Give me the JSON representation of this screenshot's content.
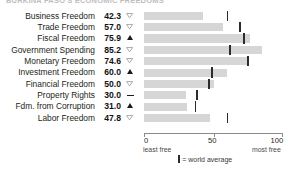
{
  "chart_title": "BURKINA FASO'S ECONOMIC FREEDOMS",
  "chart_data": {
    "type": "bar",
    "title": "BURKINA FASO'S ECONOMIC FREEDOMS",
    "orientation": "horizontal",
    "xlabel": "",
    "ylabel": "",
    "xlim": [
      0,
      100
    ],
    "grid": false,
    "legend_position": "bottom",
    "axis_ticks": [
      "0",
      "50",
      "100"
    ],
    "axis_tick_values": [
      0,
      50,
      100
    ],
    "axis_left_caption": "least free",
    "axis_right_caption": "most free",
    "legend_label": "= world average",
    "bar_color": "#d6d6d6",
    "marker_color": "#2b2b2b",
    "categories": [
      "Business Freedom",
      "Trade Freedom",
      "Fiscal Freedom",
      "Government Spending",
      "Monetary Freedom",
      "Investment Freedom",
      "Financial Freedom",
      "Property Rights",
      "Fdm. from Corruption",
      "Labor Freedom"
    ],
    "values": [
      42.3,
      57.0,
      75.9,
      85.2,
      74.6,
      60.0,
      50.0,
      30.0,
      31.0,
      47.8
    ],
    "value_labels": [
      "42.3",
      "57.0",
      "75.9",
      "85.2",
      "74.6",
      "60.0",
      "50.0",
      "30.0",
      "31.0",
      "47.8"
    ],
    "trends": [
      "down",
      "down",
      "up",
      "down",
      "down",
      "up",
      "down",
      "flat",
      "up",
      "down"
    ],
    "world_average": [
      60,
      69,
      72,
      62,
      75,
      49,
      47,
      38,
      37,
      60
    ],
    "series": [
      {
        "name": "score",
        "values": [
          42.3,
          57.0,
          75.9,
          85.2,
          74.6,
          60.0,
          50.0,
          30.0,
          31.0,
          47.8
        ]
      },
      {
        "name": "world average",
        "values": [
          60,
          69,
          72,
          62,
          75,
          49,
          47,
          38,
          37,
          60
        ]
      }
    ]
  }
}
